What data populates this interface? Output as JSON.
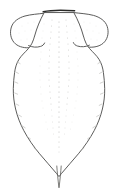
{
  "figure": {
    "kind": "scientific-line-drawing",
    "subject_label": "dorsal habitus outline",
    "caption": "",
    "background_color": "#ffffff",
    "outline_color": "#4a4a48",
    "apex_bar_color": "#2a2a28",
    "stipple_color": "#c9c9c6",
    "canvas": {
      "width": 192,
      "height": 192
    }
  },
  "anatomy": {
    "apex_bar": {
      "name": "anterior-margin-bar",
      "x1": 43,
      "y1": 11.5,
      "x2": 75,
      "y2": 10.5
    },
    "left_lobe": {
      "name": "left-lateral-lobe",
      "leftmost_x": 11,
      "top_y": 14,
      "bottom_y": 47
    },
    "right_lobe": {
      "name": "right-lateral-lobe",
      "rightmost_x": 107,
      "top_y": 14,
      "bottom_y": 47
    },
    "body": {
      "name": "abdomen-shield",
      "widest_left_x": 13,
      "widest_right_x": 105,
      "widest_y": 92,
      "apex_y": 176
    },
    "tail": {
      "name": "caudal-tip",
      "x": 59,
      "top_y": 162,
      "bottom_y": 188
    }
  },
  "texture": {
    "midline_dot_count": 34,
    "stipple_column_count": 9,
    "edge_tick_count": 16,
    "description": "faint punctation fields flanking a dotted midline"
  }
}
